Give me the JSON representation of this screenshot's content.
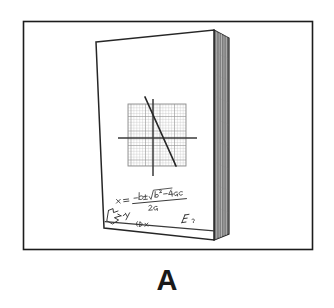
{
  "figure": {
    "panel_label": "A",
    "caption_text": "A",
    "frame": {
      "x": 23,
      "y": 21,
      "width": 290,
      "height": 229,
      "stroke_color": "#1c1c1c",
      "fill_color": "#ffffff"
    },
    "background_color": "#ffffff",
    "ink_color": "#1a1a1a"
  },
  "book": {
    "name": "notebook",
    "cover": {
      "top_left": [
        96,
        42
      ],
      "top_right": [
        214,
        30
      ],
      "bottom_right": [
        214,
        240
      ],
      "bottom_left": [
        104,
        228
      ],
      "fill_color": "#ffffff",
      "stroke_color": "#2a2a2a"
    },
    "spine": {
      "label": "page-edge-stack",
      "top_front": [
        214,
        30
      ],
      "top_back": [
        229,
        38
      ],
      "bottom_back": [
        229,
        234
      ],
      "bottom_front": [
        214,
        240
      ],
      "fill_color": "#8c8c8c",
      "stroke_color": "#2a2a2a",
      "stripe_count": 14,
      "stripe_colors": [
        "#9a9a9a",
        "#707070",
        "#b4b4b4",
        "#5e5e5e",
        "#a8a8a8",
        "#7c7c7c"
      ]
    }
  },
  "graph": {
    "name": "graph-paper-plot",
    "grid": {
      "x": 128,
      "y": 104,
      "width": 58,
      "height": 62,
      "minor_cell_px": 2.9,
      "major_every": 5,
      "minor_color": "#b0b0b0",
      "major_color": "#8a8a8a",
      "border_color": "#8a8a8a"
    },
    "axes": {
      "x_axis": {
        "x1": 118,
        "y1": 138,
        "x2": 197,
        "y2": 138
      },
      "y_axis": {
        "x1": 153,
        "y1": 99,
        "x2": 153,
        "y2": 176
      },
      "color": "#3a3a3a"
    },
    "line": {
      "label": "plotted-line",
      "x1": 145,
      "y1": 97,
      "x2": 176,
      "y2": 166,
      "color": "#2b2b2b",
      "slope_sign": "negative"
    }
  },
  "handwriting": {
    "name": "handwritten-notes",
    "formula_text": "x = (-b ± √(b² - 4ac)) / 2a",
    "formula_parts": {
      "variable": "x",
      "equals": "=",
      "numerator": "-b ± √(b² - 4ac)",
      "denominator": "2a"
    },
    "extra_marks": [
      "E",
      "y",
      "(Dx",
      "sketch-arrow"
    ],
    "ink_color": "#3a3a3a"
  }
}
